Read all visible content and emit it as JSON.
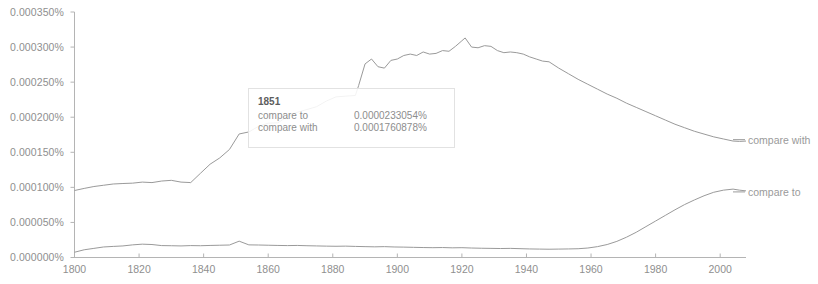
{
  "chart_data": {
    "type": "line",
    "title": "",
    "xlabel": "",
    "ylabel": "",
    "xlim": [
      1800,
      2008
    ],
    "ylim": [
      0.0,
      0.00035
    ],
    "grid": false,
    "legend_position": "right-edge-inline",
    "y_tick_labels": [
      "0.000350%",
      "0.000300%",
      "0.000250%",
      "0.000200%",
      "0.000150%",
      "0.000100%",
      "0.000050%",
      "0.000000%"
    ],
    "y_tick_values": [
      0.00035,
      0.0003,
      0.00025,
      0.0002,
      0.00015,
      0.0001,
      5e-05,
      0.0
    ],
    "x_tick_labels": [
      "1800",
      "1820",
      "1840",
      "1860",
      "1880",
      "1900",
      "1920",
      "1940",
      "1960",
      "1980",
      "2000"
    ],
    "x_tick_values": [
      1800,
      1820,
      1840,
      1860,
      1880,
      1900,
      1920,
      1940,
      1960,
      1980,
      2000
    ],
    "series": [
      {
        "name": "compare with",
        "color": "#9a9a9a",
        "x": [
          1800,
          1803,
          1806,
          1809,
          1812,
          1815,
          1818,
          1821,
          1824,
          1827,
          1830,
          1833,
          1836,
          1839,
          1842,
          1845,
          1848,
          1851,
          1854,
          1857,
          1860,
          1863,
          1866,
          1869,
          1872,
          1875,
          1878,
          1881,
          1884,
          1887,
          1888,
          1890,
          1892,
          1894,
          1896,
          1898,
          1900,
          1902,
          1904,
          1906,
          1908,
          1910,
          1912,
          1914,
          1916,
          1918,
          1920,
          1921,
          1923,
          1925,
          1927,
          1929,
          1931,
          1933,
          1935,
          1937,
          1939,
          1941,
          1943,
          1945,
          1947,
          1950,
          1953,
          1956,
          1959,
          1962,
          1965,
          1968,
          1971,
          1974,
          1977,
          1980,
          1983,
          1986,
          1989,
          1992,
          1995,
          1998,
          2001,
          2004,
          2006,
          2008
        ],
        "values": [
          9.55e-05,
          9.85e-05,
          0.0001012,
          0.000103,
          0.0001048,
          0.0001055,
          0.000106,
          0.0001075,
          0.0001068,
          0.000109,
          0.00011,
          0.0001075,
          0.0001068,
          0.00012,
          0.000133,
          0.000142,
          0.000154,
          0.0001761,
          0.000179,
          0.000187,
          0.0001915,
          0.000192,
          0.000201,
          0.000207,
          0.000211,
          0.000215,
          0.000223,
          0.000229,
          0.00023,
          0.000231,
          0.000245,
          0.000276,
          0.000283,
          0.000272,
          0.00027,
          0.000281,
          0.000283,
          0.000288,
          0.00029,
          0.000288,
          0.000293,
          0.00029,
          0.000291,
          0.000295,
          0.000294,
          0.000301,
          0.000309,
          0.000313,
          0.0003,
          0.000299,
          0.000302,
          0.000301,
          0.000295,
          0.000292,
          0.000293,
          0.000292,
          0.00029,
          0.000286,
          0.000283,
          0.00028,
          0.000279,
          0.00027,
          0.000262,
          0.000254,
          0.000247,
          0.00024,
          0.000233,
          0.000227,
          0.00022,
          0.000214,
          0.000208,
          0.000202,
          0.000196,
          0.00019,
          0.000185,
          0.00018,
          0.000176,
          0.000172,
          0.000169,
          0.000166,
          0.0001655,
          0.000166
        ]
      },
      {
        "name": "compare to",
        "color": "#9a9a9a",
        "x": [
          1800,
          1803,
          1806,
          1809,
          1812,
          1815,
          1818,
          1821,
          1824,
          1827,
          1830,
          1833,
          1836,
          1839,
          1842,
          1845,
          1848,
          1851,
          1854,
          1857,
          1860,
          1863,
          1866,
          1869,
          1872,
          1875,
          1878,
          1881,
          1884,
          1887,
          1890,
          1893,
          1896,
          1899,
          1902,
          1905,
          1908,
          1911,
          1914,
          1917,
          1920,
          1923,
          1926,
          1929,
          1932,
          1935,
          1938,
          1941,
          1944,
          1947,
          1950,
          1953,
          1956,
          1959,
          1962,
          1965,
          1968,
          1971,
          1974,
          1977,
          1980,
          1983,
          1986,
          1989,
          1992,
          1995,
          1998,
          2001,
          2004,
          2006,
          2008
        ],
        "values": [
          7.5e-06,
          1.1e-05,
          1.3e-05,
          1.5e-05,
          1.58e-05,
          1.65e-05,
          1.8e-05,
          1.9e-05,
          1.85e-05,
          1.7e-05,
          1.68e-05,
          1.65e-05,
          1.7e-05,
          1.68e-05,
          1.72e-05,
          1.75e-05,
          1.78e-05,
          2.33e-05,
          1.8e-05,
          1.78e-05,
          1.75e-05,
          1.72e-05,
          1.7e-05,
          1.72e-05,
          1.68e-05,
          1.65e-05,
          1.62e-05,
          1.6e-05,
          1.62e-05,
          1.58e-05,
          1.55e-05,
          1.52e-05,
          1.55e-05,
          1.5e-05,
          1.48e-05,
          1.45e-05,
          1.42e-05,
          1.4e-05,
          1.42e-05,
          1.38e-05,
          1.4e-05,
          1.35e-05,
          1.32e-05,
          1.3e-05,
          1.28e-05,
          1.3e-05,
          1.26e-05,
          1.22e-05,
          1.2e-05,
          1.18e-05,
          1.2e-05,
          1.22e-05,
          1.25e-05,
          1.35e-05,
          1.55e-05,
          1.85e-05,
          2.3e-05,
          2.9e-05,
          3.6e-05,
          4.4e-05,
          5.2e-05,
          6e-05,
          6.8e-05,
          7.55e-05,
          8.2e-05,
          8.8e-05,
          9.3e-05,
          9.6e-05,
          9.75e-05,
          9.6e-05,
          9.5e-05
        ]
      }
    ],
    "annotations": {
      "tooltip": {
        "year": "1851",
        "rows": [
          {
            "name": "compare to",
            "value": "0.0000233054%"
          },
          {
            "name": "compare with",
            "value": "0.0001760878%"
          }
        ]
      },
      "inline_labels": [
        {
          "text": "compare with",
          "y_value": 0.000168
        },
        {
          "text": "compare to",
          "y_value": 9.35e-05
        }
      ]
    }
  }
}
